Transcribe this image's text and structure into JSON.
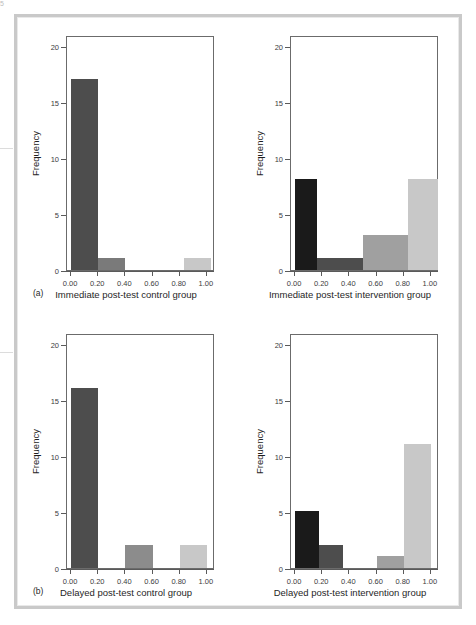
{
  "figure": {
    "background": "#ffffff",
    "frame_color": "#c9c9c9",
    "axis_color": "#6b6b6b",
    "text_color": "#1f1f1f"
  },
  "palette": {
    "black": "#1a1a1a",
    "dark_gray": "#4d4d4d",
    "mid_gray": "#5a5a5a",
    "gray": "#a0a0a0",
    "light_gray": "#c8c8c8"
  },
  "axis": {
    "y_title": "Frequency",
    "y_ticks": [
      "0",
      "5",
      "10",
      "15",
      "20"
    ],
    "y_values": [
      0,
      5,
      10,
      15,
      20
    ],
    "y_limits": [
      0,
      21
    ],
    "x_ticks": [
      "0.00",
      "0.20",
      "0.40",
      "0.60",
      "0.80",
      "1.00"
    ],
    "x_values": [
      0.0,
      0.2,
      0.4,
      0.6,
      0.8,
      1.0
    ],
    "x_limits": [
      -0.03,
      1.06
    ]
  },
  "panels": [
    {
      "letter": "(a)",
      "position": "top-left"
    },
    {
      "letter": "",
      "position": "top-right"
    },
    {
      "letter": "(b)",
      "position": "bottom-left"
    },
    {
      "letter": "",
      "position": "bottom-right"
    }
  ],
  "chart_data": [
    {
      "type": "bar",
      "id": "immediate-post-test-control-group",
      "title": "",
      "xlabel": "Immediate post-test control group",
      "ylabel": "Frequency",
      "panel_letter": "(a)",
      "xlim": [
        -0.03,
        1.06
      ],
      "ylim": [
        0,
        21
      ],
      "grid": false,
      "legend": "none",
      "bins": [
        {
          "x0": 0.0,
          "x1": 0.2,
          "value": 17,
          "color": "#4d4d4d"
        },
        {
          "x0": 0.2,
          "x1": 0.4,
          "value": 1,
          "color": "#7a7a7a"
        },
        {
          "x0": 0.4,
          "x1": 0.6,
          "value": 0,
          "color": "#9a9a9a"
        },
        {
          "x0": 0.6,
          "x1": 0.8,
          "value": 0,
          "color": "#b4b4b4"
        },
        {
          "x0": 0.83,
          "x1": 1.03,
          "value": 1,
          "color": "#c8c8c8"
        }
      ]
    },
    {
      "type": "bar",
      "id": "immediate-post-test-intervention-group",
      "title": "",
      "xlabel": "Immediate post-test intervention group",
      "ylabel": "Frequency",
      "panel_letter": "",
      "xlim": [
        -0.03,
        1.06
      ],
      "ylim": [
        0,
        21
      ],
      "grid": false,
      "legend": "none",
      "bins": [
        {
          "x0": 0.0,
          "x1": 0.165,
          "value": 8,
          "color": "#1a1a1a"
        },
        {
          "x0": 0.165,
          "x1": 0.5,
          "value": 1,
          "color": "#4d4d4d"
        },
        {
          "x0": 0.5,
          "x1": 0.83,
          "value": 3,
          "color": "#a0a0a0"
        },
        {
          "x0": 0.83,
          "x1": 1.055,
          "value": 8,
          "color": "#c8c8c8"
        }
      ]
    },
    {
      "type": "bar",
      "id": "delayed-post-test-control-group",
      "title": "",
      "xlabel": "Delayed post-test control group",
      "ylabel": "Frequency",
      "panel_letter": "(b)",
      "xlim": [
        -0.03,
        1.06
      ],
      "ylim": [
        0,
        21
      ],
      "grid": false,
      "legend": "none",
      "bins": [
        {
          "x0": 0.0,
          "x1": 0.2,
          "value": 16,
          "color": "#4d4d4d"
        },
        {
          "x0": 0.4,
          "x1": 0.6,
          "value": 2,
          "color": "#8c8c8c"
        },
        {
          "x0": 0.8,
          "x1": 1.0,
          "value": 2,
          "color": "#c8c8c8"
        }
      ]
    },
    {
      "type": "bar",
      "id": "delayed-post-test-intervention-group",
      "title": "",
      "xlabel": "Delayed post-test intervention group",
      "ylabel": "Frequency",
      "panel_letter": "",
      "xlim": [
        -0.03,
        1.06
      ],
      "ylim": [
        0,
        21
      ],
      "grid": false,
      "legend": "none",
      "bins": [
        {
          "x0": 0.0,
          "x1": 0.175,
          "value": 5,
          "color": "#1a1a1a"
        },
        {
          "x0": 0.175,
          "x1": 0.35,
          "value": 2,
          "color": "#4d4d4d"
        },
        {
          "x0": 0.6,
          "x1": 0.8,
          "value": 1,
          "color": "#a0a0a0"
        },
        {
          "x0": 0.8,
          "x1": 1.0,
          "value": 11,
          "color": "#c8c8c8"
        }
      ]
    }
  ]
}
